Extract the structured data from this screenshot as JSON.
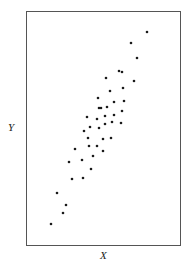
{
  "chart_data": {
    "type": "scatter",
    "title": "",
    "xlabel": "X",
    "ylabel": "Y",
    "grid": false,
    "legend": null,
    "ticks": false,
    "frame_px": {
      "x0": 26,
      "y0": 11,
      "x1": 180,
      "y1": 245
    },
    "points_px": [
      [
        147,
        32
      ],
      [
        131,
        43
      ],
      [
        137,
        58
      ],
      [
        119,
        71
      ],
      [
        122,
        72
      ],
      [
        106,
        78
      ],
      [
        134,
        81
      ],
      [
        123,
        88
      ],
      [
        110,
        91
      ],
      [
        98,
        98
      ],
      [
        124,
        101
      ],
      [
        114,
        102
      ],
      [
        99,
        108
      ],
      [
        101,
        108
      ],
      [
        107,
        107
      ],
      [
        122,
        111
      ],
      [
        87,
        117
      ],
      [
        97,
        119
      ],
      [
        105,
        116
      ],
      [
        114,
        115
      ],
      [
        90,
        127
      ],
      [
        99,
        128
      ],
      [
        105,
        124
      ],
      [
        112,
        122
      ],
      [
        121,
        123
      ],
      [
        84,
        131
      ],
      [
        88,
        138
      ],
      [
        103,
        139
      ],
      [
        111,
        138
      ],
      [
        75,
        149
      ],
      [
        89,
        146
      ],
      [
        97,
        146
      ],
      [
        103,
        151
      ],
      [
        93,
        156
      ],
      [
        69,
        162
      ],
      [
        82,
        160
      ],
      [
        91,
        169
      ],
      [
        72,
        179
      ],
      [
        83,
        178
      ],
      [
        57,
        193
      ],
      [
        66,
        205
      ],
      [
        63,
        213
      ],
      [
        51,
        224
      ]
    ]
  },
  "colors": {
    "frame": "#555555",
    "point": "#1a1a1a"
  }
}
